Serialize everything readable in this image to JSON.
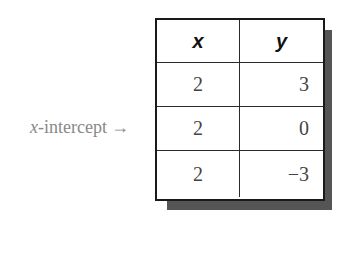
{
  "table": {
    "headers": [
      "x",
      "y"
    ],
    "rows": [
      {
        "x": "2",
        "y": "3"
      },
      {
        "x": "2",
        "y": "0"
      },
      {
        "x": "2",
        "y": "−3"
      }
    ]
  },
  "annotation": {
    "variable": "x",
    "label": "-intercept",
    "arrow": "→",
    "points_to_row": 2
  },
  "colors": {
    "border": "#1a1a1a",
    "shadow": "#555555",
    "cell_text": "#444444",
    "annotation_text": "#888888"
  }
}
